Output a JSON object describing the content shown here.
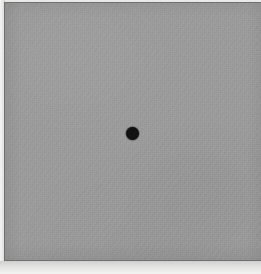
{
  "image": {
    "title": "Uniform gray field with a single central black dot",
    "description": "A photographic/printed plate: a large flat mid-gray rectangle with visible paper grain, bordered by a thin dark keyline and a light paper margin along the left and bottom edges. A small solid black circular dot sits slightly above and left of the geometric center.",
    "width_px": 261,
    "height_px": 274,
    "medium": "printed halftone plate / scanned figure",
    "background_label": "gray-field",
    "subject_label": "black-dot"
  },
  "colors": {
    "page_background": "#ffffff",
    "paper_margin": "#e9e9e7",
    "paper_margin_highlight": "#f4f4f3",
    "keyline": "#6f6f6f",
    "gray_field": "#9a9a9a",
    "dot": "#111111"
  },
  "geometry": {
    "paper_margin": {
      "left": 0,
      "top": 0,
      "width": 261,
      "height": 274
    },
    "keyline": {
      "left": 4,
      "top": 2,
      "right": 0,
      "bottom": 13
    },
    "gray_field": {
      "left": 5,
      "top": 3,
      "width": 256,
      "height": 257
    },
    "dot": {
      "center_x": 132,
      "center_y": 133,
      "diameter": 13,
      "radius": 6.5
    },
    "left_margin_strip_width": 5,
    "bottom_margin_strip_height": 13,
    "top_keyline_thickness": 2
  },
  "annotations": {
    "dot_role": "fixation-point",
    "dot_count": 1,
    "text_present": false,
    "axis_present": false,
    "legend_present": false
  }
}
